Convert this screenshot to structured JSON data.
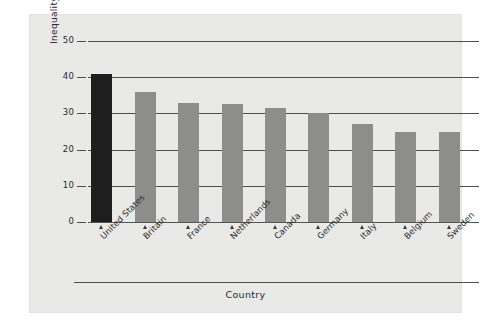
{
  "chart_data": {
    "type": "bar",
    "title": "",
    "xlabel": "Country",
    "ylabel": "Inequality",
    "categories": [
      "United States",
      "Britain",
      "France",
      "Netherlands",
      "Canada",
      "Germany",
      "Italy",
      "Belgium",
      "Sweden"
    ],
    "values": [
      41,
      36,
      32.8,
      32.5,
      31.5,
      30,
      27,
      24.8,
      24.8
    ],
    "ylim": [
      0,
      50
    ],
    "yticks": [
      0,
      10,
      20,
      30,
      40,
      50
    ],
    "ytick_labels": [
      "0",
      "10",
      "20",
      "30",
      "40",
      "50"
    ],
    "grid": true,
    "legend": "none",
    "highlight_category": "United States",
    "colors": {
      "bar": "#8d8d8b",
      "bar_highlight": "#1e1e1e",
      "panel_background": "#e9e9e7",
      "figure_background": "#ffffff",
      "axis": "#4d4d4d",
      "text": "#2b2b2b"
    }
  }
}
